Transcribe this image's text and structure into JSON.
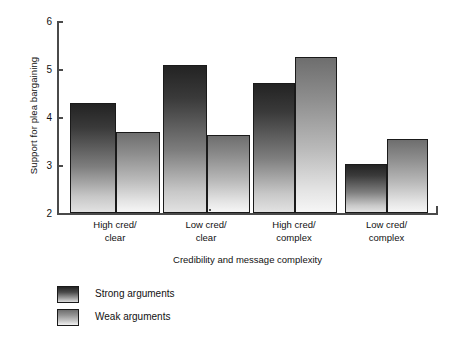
{
  "chart_data": {
    "type": "bar",
    "title": "",
    "xlabel": "Credibility and message complexity",
    "ylabel": "Support for plea bargaining",
    "categories": [
      "High cred/\nclear",
      "Low cred/\nclear",
      "High cred/\ncomplex",
      "Low cred/\ncomplex"
    ],
    "category_lines": [
      [
        "High cred/",
        "clear"
      ],
      [
        "Low cred/",
        "clear"
      ],
      [
        "High cred/",
        "complex"
      ],
      [
        "Low cred/",
        "complex"
      ]
    ],
    "series": [
      {
        "name": "Strong arguments",
        "values": [
          4.3,
          5.08,
          4.7,
          3.02
        ]
      },
      {
        "name": "Weak arguments",
        "values": [
          3.68,
          3.62,
          5.25,
          3.55
        ]
      }
    ],
    "ylim": [
      2,
      6
    ],
    "yticks": [
      2,
      3,
      4,
      5,
      6
    ],
    "ytick_labels": [
      "2",
      "3",
      "4",
      "5",
      "6"
    ],
    "grid": false,
    "legend_position": "below-left"
  },
  "axis": {
    "y_label": "Support for plea bargaining",
    "x_label": "Credibility and message complexity",
    "y_ticks": [
      "6",
      "5",
      "4",
      "3",
      "2"
    ]
  },
  "legend": {
    "items": [
      {
        "label": "Strong arguments",
        "swatch": "strong-gradient-swatch"
      },
      {
        "label": "Weak arguments",
        "swatch": "weak-gradient-swatch"
      }
    ]
  },
  "categories": [
    {
      "line1": "High cred/",
      "line2": "clear"
    },
    {
      "line1": "Low cred/",
      "line2": "clear"
    },
    {
      "line1": "High cred/",
      "line2": "complex"
    },
    {
      "line1": "Low cred/",
      "line2": "complex"
    }
  ],
  "colors": {
    "axis": "#4a4a4a",
    "bar_outline": "#1a1a1a",
    "strong_top": "#232323",
    "strong_bottom": "#e2e2e2",
    "weak_top": "#6e6e6e",
    "weak_bottom": "#f6f6f6",
    "background": "#ffffff"
  }
}
